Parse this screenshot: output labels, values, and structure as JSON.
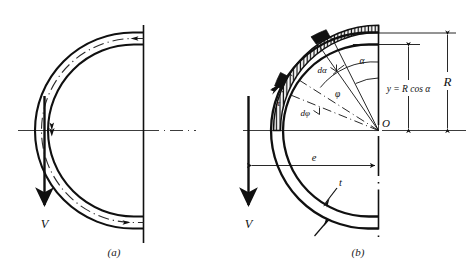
{
  "figure": {
    "background_color": "#ffffff",
    "ink_color": "#101010",
    "width": 471,
    "height": 272
  },
  "panels": [
    {
      "id": "a",
      "caption": "(a)",
      "labels": {
        "load": "V"
      },
      "elements": {
        "outer_arc": "outer-pipe-wall-arc",
        "inner_arc": "inner-pipe-wall-arc",
        "centerline_arc": "flow-centerline-arc",
        "flow_arrows": "flow-direction-arrows",
        "vertical_axis": "vertical-symmetry-line",
        "horizontal_axis": "horizontal-symmetry-line",
        "load_arrow": "shear-load-arrow"
      }
    },
    {
      "id": "b",
      "caption": "(b)",
      "labels": {
        "load": "V",
        "shear_stress": "τ",
        "angle_alpha": "α",
        "delta_alpha": "dα",
        "angle_phi": "φ",
        "delta_phi": "dφ",
        "origin": "O",
        "radius": "R",
        "ordinate": "y = R cos α",
        "eccentricity": "e",
        "thickness": "t"
      },
      "elements": {
        "outer_arc": "outer-pipe-wall-arc",
        "inner_arc": "inner-pipe-wall-arc",
        "stress_distribution": "shear-stress-hatched-band",
        "radial_lines": "radial-construction-lines",
        "dimension_R": "radius-dimension-line",
        "dimension_y": "ordinate-dimension-line",
        "dimension_e": "eccentricity-dimension-line",
        "leader_t": "thickness-leader-line",
        "vertical_axis": "vertical-symmetry-line",
        "horizontal_axis": "horizontal-symmetry-line",
        "load_arrow": "shear-load-arrow"
      }
    }
  ]
}
